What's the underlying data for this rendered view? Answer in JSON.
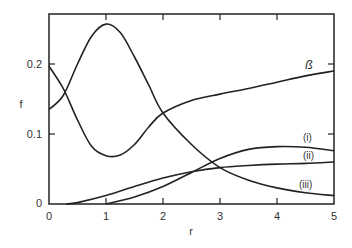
{
  "chart_data": {
    "type": "line",
    "title": "",
    "xlabel": "r",
    "ylabel": "f",
    "xlim": [
      0,
      5
    ],
    "ylim": [
      0,
      0.27
    ],
    "xticks": [
      "0",
      "1",
      "2",
      "3",
      "4",
      "5"
    ],
    "yticks": [
      "0",
      "0.1",
      "0.2"
    ],
    "grid": false,
    "legend": "inline labels",
    "series": [
      {
        "name": "peak curve (unlabeled)",
        "x": [
          0,
          0.25,
          0.5,
          0.75,
          1.0,
          1.25,
          1.5,
          1.75,
          2.0,
          2.5,
          3.0,
          3.5,
          4.0,
          4.5,
          5.0
        ],
        "values": [
          0.135,
          0.155,
          0.2,
          0.24,
          0.257,
          0.245,
          0.21,
          0.17,
          0.13,
          0.085,
          0.052,
          0.034,
          0.023,
          0.016,
          0.012
        ]
      },
      {
        "name": "ß",
        "x": [
          0,
          0.25,
          0.5,
          0.75,
          1.0,
          1.25,
          1.5,
          1.75,
          2.0,
          2.5,
          3.0,
          3.5,
          4.0,
          4.5,
          5.0
        ],
        "values": [
          0.197,
          0.165,
          0.12,
          0.082,
          0.069,
          0.07,
          0.085,
          0.11,
          0.13,
          0.148,
          0.157,
          0.165,
          0.174,
          0.183,
          0.19
        ]
      },
      {
        "name": "(i)",
        "x": [
          1.0,
          1.5,
          2.0,
          2.5,
          3.0,
          3.5,
          4.0,
          4.5,
          5.0
        ],
        "values": [
          0.0,
          0.01,
          0.025,
          0.045,
          0.065,
          0.078,
          0.082,
          0.081,
          0.076
        ]
      },
      {
        "name": "(ii)",
        "x": [
          0.3,
          0.5,
          1.0,
          1.5,
          2.0,
          2.5,
          3.0,
          3.5,
          4.0,
          4.5,
          5.0
        ],
        "values": [
          0.0,
          0.002,
          0.012,
          0.025,
          0.037,
          0.046,
          0.052,
          0.055,
          0.057,
          0.058,
          0.06
        ]
      }
    ],
    "annotations": [
      "ß",
      "(i)",
      "(ii)",
      "(iii)"
    ]
  },
  "labels": {
    "xlabel": "r",
    "ylabel": "f",
    "beta": "ß",
    "i": "(i)",
    "ii": "(ii)",
    "iii": "(iii)",
    "xticks": [
      "0",
      "1",
      "2",
      "3",
      "4",
      "5"
    ],
    "yticks": [
      "0",
      "0.1",
      "0.2"
    ]
  }
}
